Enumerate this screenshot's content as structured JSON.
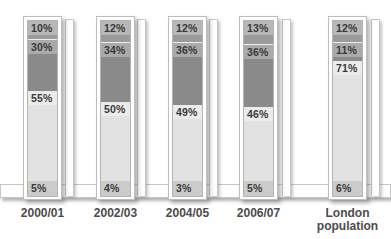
{
  "chart_data": {
    "type": "bar",
    "stacked": true,
    "unit": "%",
    "categories": [
      "2000/01",
      "2002/03",
      "2004/05",
      "2006/07",
      "London population"
    ],
    "series": [
      {
        "name": "top-medium-gray-segment",
        "color": "#9b9b9b",
        "values": [
          10,
          12,
          12,
          13,
          12
        ]
      },
      {
        "name": "dark-gray-segment",
        "color": "#8a8a8a",
        "values": [
          30,
          34,
          36,
          36,
          11
        ]
      },
      {
        "name": "light-gray-segment",
        "color": "#e2e2e2",
        "values": [
          55,
          50,
          49,
          46,
          71
        ]
      },
      {
        "name": "bottom-pale-gray-segment",
        "color": "#cbcbcb",
        "values": [
          5,
          4,
          3,
          5,
          6
        ]
      }
    ],
    "ylim": [
      0,
      100
    ],
    "grid": false,
    "legend": "none"
  },
  "bars": [
    {
      "category": "2000/01",
      "labels": [
        "10%",
        "30%",
        "55%",
        "5%"
      ],
      "pcts": [
        10,
        30,
        55,
        5
      ]
    },
    {
      "category": "2002/03",
      "labels": [
        "12%",
        "34%",
        "50%",
        "4%"
      ],
      "pcts": [
        12,
        34,
        50,
        4
      ]
    },
    {
      "category": "2004/05",
      "labels": [
        "12%",
        "36%",
        "49%",
        "3%"
      ],
      "pcts": [
        12,
        36,
        49,
        3
      ]
    },
    {
      "category": "2006/07",
      "labels": [
        "13%",
        "36%",
        "46%",
        "5%"
      ],
      "pcts": [
        13,
        36,
        46,
        5
      ]
    },
    {
      "category": "London population",
      "labels": [
        "12%",
        "11%",
        "71%",
        "6%"
      ],
      "pcts": [
        12,
        11,
        71,
        6
      ]
    }
  ],
  "colors": {
    "background": "#ffffff",
    "frame_border": "#bdbdbd",
    "segment_label_text": "#393939",
    "axis_label_text": "#4c4c4c"
  }
}
